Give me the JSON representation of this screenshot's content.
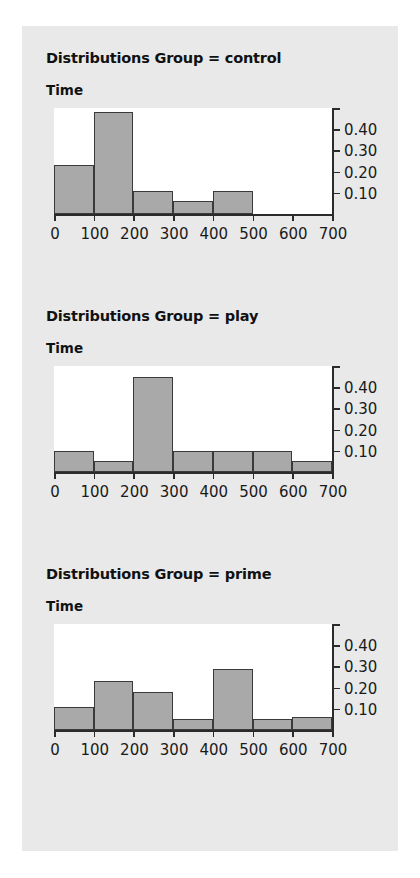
{
  "page": {
    "background_color": "#ffffff",
    "panel_color": "#e9e9e9",
    "plot_background": "#ffffff",
    "bar_fill": "#a9a9a9",
    "bar_stroke": "#3a3a3a",
    "axis_color": "#2b2b2b",
    "axis_sublabel": "Time"
  },
  "chart_data": [
    {
      "type": "bar",
      "title": "Distributions Group = control",
      "ylabel": "Time",
      "xlabel": "",
      "group": "control",
      "categories": [
        "0-100",
        "100-200",
        "200-300",
        "300-400",
        "400-500",
        "500-600",
        "600-700"
      ],
      "bin_starts": [
        0,
        100,
        200,
        300,
        400,
        500,
        600
      ],
      "bin_width": 100,
      "values": [
        0.23,
        0.48,
        0.11,
        0.06,
        0.11,
        0.0,
        0.0
      ],
      "xlim": [
        0,
        700
      ],
      "ylim": [
        0,
        0.5
      ],
      "xticks": [
        0,
        100,
        200,
        300,
        400,
        500,
        600,
        700
      ],
      "xticklabels": [
        "0",
        "100",
        "200",
        "300",
        "400",
        "500",
        "600",
        "700"
      ],
      "yticks": [
        0.1,
        0.2,
        0.3,
        0.4,
        0.5
      ],
      "yticklabels": [
        "0.10",
        "0.20",
        "0.30",
        "0.40",
        ""
      ],
      "grid": false,
      "legend": "none"
    },
    {
      "type": "bar",
      "title": "Distributions Group = play",
      "ylabel": "Time",
      "xlabel": "",
      "group": "play",
      "categories": [
        "0-100",
        "100-200",
        "200-300",
        "300-400",
        "400-500",
        "500-600",
        "600-700"
      ],
      "bin_starts": [
        0,
        100,
        200,
        300,
        400,
        500,
        600
      ],
      "bin_width": 100,
      "values": [
        0.1,
        0.05,
        0.45,
        0.1,
        0.1,
        0.1,
        0.05
      ],
      "xlim": [
        0,
        700
      ],
      "ylim": [
        0,
        0.5
      ],
      "xticks": [
        0,
        100,
        200,
        300,
        400,
        500,
        600,
        700
      ],
      "xticklabels": [
        "0",
        "100",
        "200",
        "300",
        "400",
        "500",
        "600",
        "700"
      ],
      "yticks": [
        0.1,
        0.2,
        0.3,
        0.4,
        0.5
      ],
      "yticklabels": [
        "0.10",
        "0.20",
        "0.30",
        "0.40",
        ""
      ],
      "grid": false,
      "legend": "none"
    },
    {
      "type": "bar",
      "title": "Distributions Group = prime",
      "ylabel": "Time",
      "xlabel": "",
      "group": "prime",
      "categories": [
        "0-100",
        "100-200",
        "200-300",
        "300-400",
        "400-500",
        "500-600",
        "600-700"
      ],
      "bin_starts": [
        0,
        100,
        200,
        300,
        400,
        500,
        600
      ],
      "bin_width": 100,
      "values": [
        0.11,
        0.23,
        0.18,
        0.05,
        0.29,
        0.05,
        0.06
      ],
      "xlim": [
        0,
        700
      ],
      "ylim": [
        0,
        0.5
      ],
      "xticks": [
        0,
        100,
        200,
        300,
        400,
        500,
        600,
        700
      ],
      "xticklabels": [
        "0",
        "100",
        "200",
        "300",
        "400",
        "500",
        "600",
        "700"
      ],
      "yticks": [
        0.1,
        0.2,
        0.3,
        0.4,
        0.5
      ],
      "yticklabels": [
        "0.10",
        "0.20",
        "0.30",
        "0.40",
        ""
      ],
      "grid": false,
      "legend": "none"
    }
  ]
}
